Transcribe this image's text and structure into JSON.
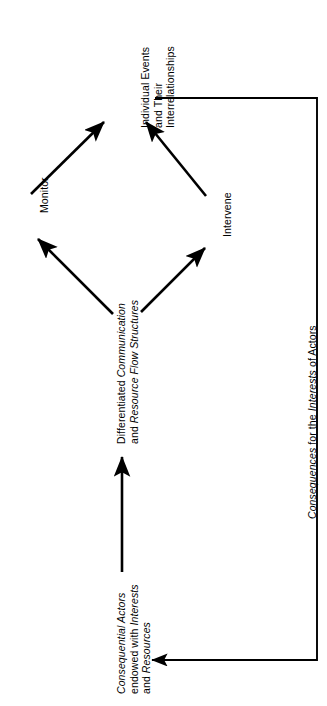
{
  "figure": {
    "name": "cybernetic-feedback-loop-diagram",
    "orientation": "rotated-90-ccw",
    "background_color": "#ffffff",
    "line_color": "#000000"
  },
  "nodes": {
    "events": {
      "id": "individual-events",
      "lines": [
        "Individual Events",
        "and Their",
        "Interrelationships"
      ],
      "style": "regular"
    },
    "structures": {
      "id": "differentiated-communication",
      "lines": [
        "Differentiated Communication",
        "and Resource Flow Structures"
      ],
      "line1_plain": "Differentiated ",
      "line1_italic": "Communication",
      "line2_plain": "and ",
      "line2_italic": "Resource Flow Structures",
      "style": "mixed-italic"
    },
    "actors": {
      "id": "consequential-actors",
      "lines": [
        "Consequential Actors",
        "endowed with Interests",
        "and Resources"
      ],
      "line1_italic": "Consequential Actors",
      "line2_plain": "endowed with ",
      "line2_italic": "Interests",
      "line3_plain": "and ",
      "line3_italic": "Resources",
      "style": "mixed-italic"
    }
  },
  "edge_labels": {
    "monitor": "Monitor",
    "intervene": "Intervene",
    "consequences": {
      "text": "Consequences for the Interests of Actors",
      "part1_italic": "Consequences",
      "part2_plain": " for the ",
      "part3_italic": "Interests",
      "part4_plain": " of Actors"
    }
  }
}
